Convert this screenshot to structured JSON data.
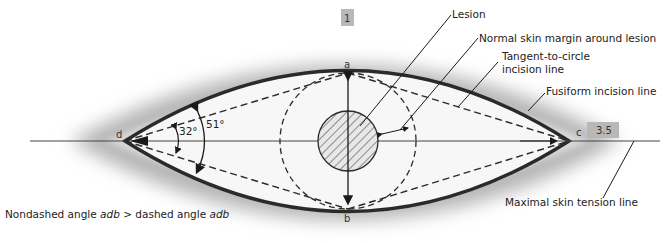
{
  "diagram": {
    "labels": {
      "lesion": "Lesion",
      "margin": "Normal skin margin around lesion",
      "tangent_line1": "Tangent-to-circle",
      "tangent_line2": "incision line",
      "fusiform": "Fusiform incision line",
      "tension": "Maximal skin tension line"
    },
    "points": {
      "a": "a",
      "b": "b",
      "c": "c",
      "d": "d"
    },
    "ratio": {
      "width": "1",
      "length": "3.5"
    },
    "angles": {
      "dashed": "32°",
      "nondashed": "51°"
    },
    "caption": {
      "part1": "Nondashed angle ",
      "adb1": "adb",
      "part2": " > dashed angle ",
      "adb2": "adb"
    },
    "colors": {
      "line": "#2a2a2a",
      "halo": "#9a9a9a",
      "label_box": "#b8b8b8"
    }
  }
}
